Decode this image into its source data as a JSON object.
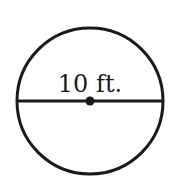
{
  "diagram": {
    "shape": "circle",
    "diameter_label": "10 ft.",
    "colors": {
      "stroke": "#1a1a1a",
      "background": "#ffffff"
    },
    "circle": {
      "cx": 90,
      "cy": 101,
      "r": 73
    },
    "diameter_line": {
      "x1": 17,
      "y1": 101,
      "x2": 163,
      "y2": 101
    },
    "center_point": {
      "cx": 90,
      "cy": 101,
      "r": 4
    }
  }
}
